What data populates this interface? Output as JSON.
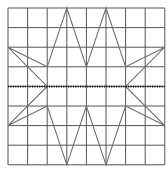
{
  "diagram": {
    "type": "grid-symmetry",
    "grid": {
      "cols": 8,
      "rows": 8,
      "origin_x": 8,
      "origin_y": 8,
      "cell": 19.6,
      "line_color": "#555555",
      "line_width": 1
    },
    "shape": {
      "name": "star-polygon",
      "stroke": "#6e6e6e",
      "stroke_width": 1.1,
      "vertices": [
        [
          3,
          0
        ],
        [
          4,
          3
        ],
        [
          5,
          0
        ],
        [
          6,
          3
        ],
        [
          8,
          2
        ],
        [
          6,
          4
        ],
        [
          8,
          6
        ],
        [
          6,
          5
        ],
        [
          5,
          8
        ],
        [
          4,
          5
        ],
        [
          3,
          8
        ],
        [
          2,
          5
        ],
        [
          0,
          6
        ],
        [
          2,
          4
        ],
        [
          0,
          2
        ],
        [
          2,
          3
        ]
      ]
    },
    "symmetry_line": {
      "row": 4,
      "from_col": 0,
      "to_col": 8,
      "color": "#1a1a1a",
      "style": "dotted",
      "width": 2
    }
  }
}
